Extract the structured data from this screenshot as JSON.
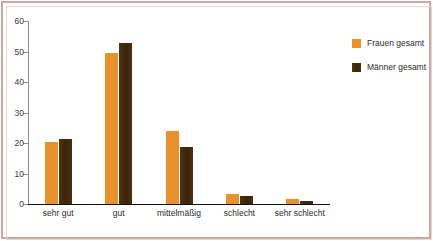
{
  "chart_data": {
    "type": "bar",
    "title": "",
    "subtitle": "",
    "xlabel": "",
    "ylabel": "",
    "ylim": [
      0,
      60
    ],
    "yticks": [
      0,
      10,
      20,
      30,
      40,
      50,
      60
    ],
    "ytick_labels": [
      "0",
      "10",
      "20",
      "30",
      "40",
      "50",
      "60"
    ],
    "grid": false,
    "legend_position": "right",
    "categories": [
      "sehr gut",
      "gut",
      "mittelmäßig",
      "schlecht",
      "sehr schlecht"
    ],
    "series": [
      {
        "name": "Frauen gesamt",
        "color": "#e8922e",
        "values": [
          20.4,
          49.5,
          23.8,
          3.3,
          1.6
        ]
      },
      {
        "name": "Männer gesamt",
        "color": "#432b0d",
        "values": [
          21.3,
          52.8,
          18.8,
          2.6,
          1.0
        ]
      }
    ]
  },
  "colors": {
    "frauen": "#e8922e",
    "maenner": "#432b0d",
    "frame": "#c9a9a2",
    "axis": "#8c8c8c",
    "background": "#ffffff"
  }
}
